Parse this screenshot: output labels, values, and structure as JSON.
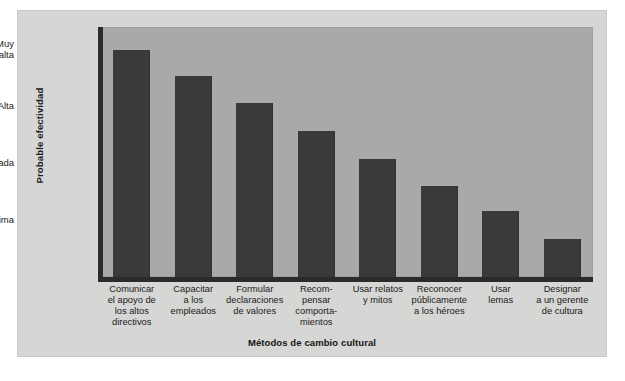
{
  "chart_data": {
    "type": "bar",
    "title": "",
    "xlabel": "Métodos de cambio cultural",
    "ylabel": "Probable efectividad",
    "grid": false,
    "legend": "none",
    "categories": [
      "Comunicar\nel apoyo de\nlos altos\ndirectivos",
      "Capacitar\na los\nempleados",
      "Formular\ndeclaraciones\nde valores",
      "Recom-\npensar\ncomporta-\nmientos",
      "Usar relatos\ny mitos",
      "Reconocer\npúblicamente\na los héroes",
      "Usar\nlemas",
      "Designar\na un gerente\nde cultura"
    ],
    "ytick_labels": [
      "Muy\nalta",
      "Alta",
      "Moderada",
      "Mínima"
    ],
    "ytick_values": [
      4.0,
      3.0,
      2.0,
      1.0
    ],
    "ylim": [
      0.0,
      4.4
    ],
    "values": [
      4.0,
      3.53,
      3.06,
      2.57,
      2.08,
      1.61,
      1.16,
      0.67
    ],
    "bar_color": "#3a3a3a",
    "plot_bg_color": "#a9a9a7",
    "figure_bg_color": "#d6d6d4",
    "axis_color": "#2b2b2b"
  },
  "layout": {
    "plot_left_px": 84,
    "plot_top_px": 17,
    "plot_width_px": 492,
    "plot_height_px": 250,
    "bar_width_px": 37,
    "bar_slot_width_px": 61.5,
    "ytick_y_px": [
      13,
      77,
      138,
      198
    ]
  }
}
